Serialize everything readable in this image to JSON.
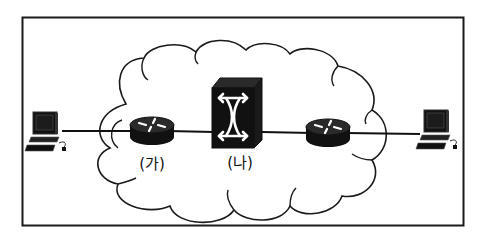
{
  "diagram": {
    "type": "network-topology",
    "frame": {
      "stroke": "#1a1a1a"
    },
    "cloud": {
      "stroke": "#1a1a1a",
      "fill": "#ffffff"
    },
    "nodes": [
      {
        "id": "pc-left",
        "kind": "computer",
        "label": ""
      },
      {
        "id": "router-a",
        "kind": "router",
        "label": "(가)"
      },
      {
        "id": "switch-b",
        "kind": "switch",
        "label": "(나)"
      },
      {
        "id": "router-c",
        "kind": "router",
        "label": ""
      },
      {
        "id": "pc-right",
        "kind": "computer",
        "label": ""
      }
    ],
    "links": [
      [
        "pc-left",
        "router-a"
      ],
      [
        "router-a",
        "switch-b"
      ],
      [
        "switch-b",
        "router-c"
      ],
      [
        "router-c",
        "pc-right"
      ]
    ],
    "colors": {
      "device": "#111111",
      "device_top": "#2a2a2a",
      "line": "#111111",
      "icon_glyph": "#ffffff"
    }
  }
}
